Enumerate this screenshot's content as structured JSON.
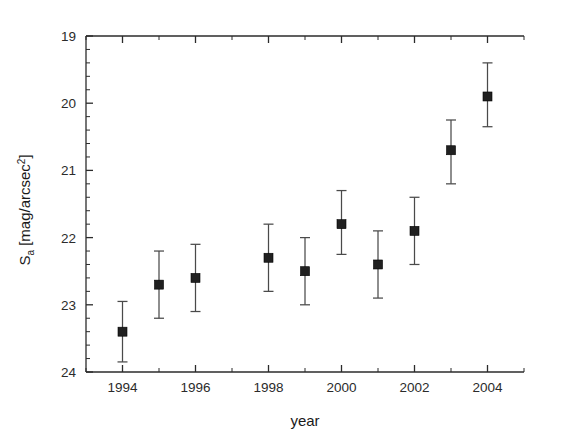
{
  "chart_data": {
    "type": "scatter",
    "title": "",
    "xlabel": "year",
    "ylabel": "S_a [mag/arcsec^2]",
    "ylabel_parts": {
      "symbol": "S",
      "subscript": "a",
      "unit_open": " [mag/arcsec",
      "superscript": "2",
      "unit_close": "]"
    },
    "xlim": [
      1993,
      2005
    ],
    "ylim": [
      24,
      19
    ],
    "y_inverted": true,
    "grid": false,
    "legend": null,
    "x_major_ticks": [
      1994,
      1996,
      1998,
      2000,
      2002,
      2004
    ],
    "x_tick_labels": [
      "1994",
      "1996",
      "1998",
      "2000",
      "2002",
      "2004"
    ],
    "x_minor_ticks": [
      1993,
      1995,
      1997,
      1999,
      2001,
      2003,
      2005
    ],
    "y_major_ticks": [
      19,
      20,
      21,
      22,
      23,
      24
    ],
    "y_tick_labels": [
      "19",
      "20",
      "21",
      "22",
      "23",
      "24"
    ],
    "y_minor_step": 0.1,
    "marker_style": "filled-square",
    "marker_size_px": 9,
    "x": [
      1994,
      1995,
      1996,
      1998,
      1999,
      2000,
      2001,
      2002,
      2003,
      2004
    ],
    "values": [
      23.4,
      22.7,
      22.6,
      22.3,
      22.5,
      21.8,
      22.4,
      21.9,
      20.7,
      19.9
    ],
    "yerr_low": [
      0.45,
      0.5,
      0.5,
      0.5,
      0.5,
      0.45,
      0.45,
      0.45,
      0.45,
      0.45
    ],
    "yerr_high": [
      0.45,
      0.5,
      0.5,
      0.5,
      0.5,
      0.45,
      0.45,
      0.45,
      0.45,
      0.45
    ],
    "points": [
      {
        "year": 1994,
        "value": 23.4,
        "low": 23.85,
        "high": 22.95
      },
      {
        "year": 1995,
        "value": 22.7,
        "low": 23.2,
        "high": 22.2
      },
      {
        "year": 1996,
        "value": 22.6,
        "low": 23.1,
        "high": 22.1
      },
      {
        "year": 1998,
        "value": 22.3,
        "low": 22.8,
        "high": 21.8
      },
      {
        "year": 1999,
        "value": 22.5,
        "low": 23.0,
        "high": 22.0
      },
      {
        "year": 2000,
        "value": 21.8,
        "low": 22.25,
        "high": 21.3
      },
      {
        "year": 2001,
        "value": 22.4,
        "low": 22.9,
        "high": 21.9
      },
      {
        "year": 2002,
        "value": 21.9,
        "low": 22.4,
        "high": 21.4
      },
      {
        "year": 2003,
        "value": 20.7,
        "low": 21.2,
        "high": 20.25
      },
      {
        "year": 2004,
        "value": 19.9,
        "low": 20.35,
        "high": 19.4
      }
    ],
    "colors": {
      "marker": "#202020",
      "errorbar": "#4a4a4a",
      "axis": "#2b2b2b",
      "background": "#ffffff"
    }
  }
}
